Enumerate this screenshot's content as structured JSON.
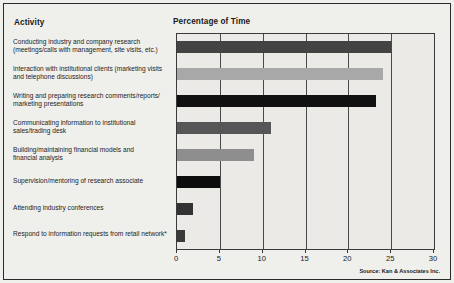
{
  "figure": {
    "activity_header": "Activity",
    "value_header": "Percentage of Time",
    "source": "Source: Kan & Associates Inc."
  },
  "chart_data": {
    "type": "bar",
    "orientation": "horizontal",
    "title": "Percentage of Time",
    "xlabel": "Percentage of Time",
    "ylabel": "Activity",
    "xlim": [
      0,
      30
    ],
    "xticks": [
      0,
      5,
      10,
      15,
      20,
      25,
      30
    ],
    "grid": true,
    "legend": "none",
    "categories": [
      "Conducting industry and company research (meetings/calls with management, site visits, etc.)",
      "Interaction with institutional clients (marketing visits and telephone discussions)",
      "Writing and preparing research comments/reports/ marketing presentations",
      "Communicating information to institutional sales/trading desk",
      "Building/maintaining financial models and financial analysis",
      "Supervision/mentoring of research associate",
      "Attending industry conferences",
      "Respond to information requests from retail network*"
    ],
    "category_lines": [
      [
        "Conducting industry and company research",
        "(meetings/calls with management, site visits, etc.)"
      ],
      [
        "Interaction with institutional clients (marketing visits",
        "and telephone discussions)"
      ],
      [
        "Writing and preparing research comments/reports/",
        "marketing presentations"
      ],
      [
        "Communicating information to institutional",
        "sales/trading desk"
      ],
      [
        "Building/maintaining financial models and",
        "financial analysis"
      ],
      [
        "Supervision/mentoring of research associate"
      ],
      [
        "Attending industry conferences"
      ],
      [
        "Respond to information requests from retail network*"
      ]
    ],
    "values": [
      25,
      24,
      23.2,
      11,
      9,
      5,
      1.9,
      0.9
    ],
    "bar_colors": [
      "#434343",
      "#a8a8a8",
      "#111111",
      "#565656",
      "#8e8e8e",
      "#0d0d0d",
      "#333333",
      "#3a3a3a"
    ]
  }
}
